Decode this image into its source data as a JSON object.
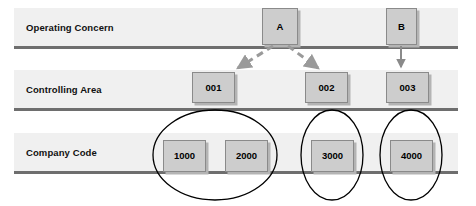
{
  "diagram": {
    "colors": {
      "band_fill": "#f0f0f0",
      "band_border": "#6e6e6e",
      "node_fill": "#cdcdcd",
      "node_border": "#8a8a8a",
      "node_shadow": "#b4b4b4",
      "connector_dashed": "#9a9a9a",
      "connector_solid": "#8a8a8a",
      "grouping_ellipse": "#000000",
      "text": "#111111"
    },
    "bands": [
      {
        "label": "Operating Concern"
      },
      {
        "label": "Controlling Area"
      },
      {
        "label": "Company Code"
      }
    ],
    "nodes": {
      "operating_concern": [
        {
          "id": "A",
          "label": "A"
        },
        {
          "id": "B",
          "label": "B"
        }
      ],
      "controlling_area": [
        {
          "id": "001",
          "label": "001"
        },
        {
          "id": "002",
          "label": "002"
        },
        {
          "id": "003",
          "label": "003"
        }
      ],
      "company_code": [
        {
          "id": "1000",
          "label": "1000"
        },
        {
          "id": "2000",
          "label": "2000"
        },
        {
          "id": "3000",
          "label": "3000"
        },
        {
          "id": "4000",
          "label": "4000"
        }
      ]
    },
    "connectors": [
      {
        "from": "A",
        "to": "001",
        "style": "dashed",
        "arrowhead": "solid-triangle"
      },
      {
        "from": "A",
        "to": "002",
        "style": "dashed",
        "arrowhead": "solid-triangle"
      },
      {
        "from": "B",
        "to": "003",
        "style": "solid",
        "arrowhead": "solid-triangle"
      }
    ],
    "groupings": [
      {
        "id": "group-001",
        "members": [
          "1000",
          "2000"
        ],
        "shape": "ellipse"
      },
      {
        "id": "group-002",
        "members": [
          "3000"
        ],
        "shape": "ellipse"
      },
      {
        "id": "group-003",
        "members": [
          "4000"
        ],
        "shape": "ellipse"
      }
    ]
  }
}
